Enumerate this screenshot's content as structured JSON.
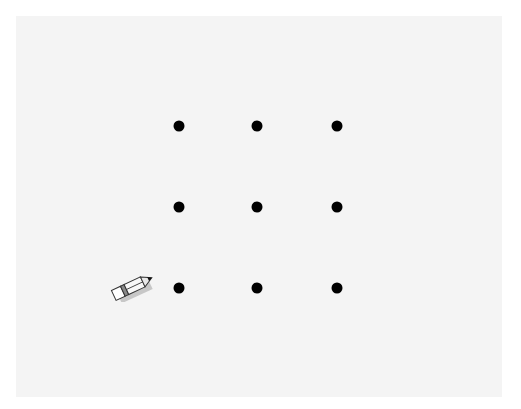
{
  "puzzle": {
    "type": "nine-dots",
    "background_color": "#f4f4f4",
    "dot_color": "#000000",
    "dots": [
      {
        "row": 1,
        "col": 1,
        "x": 179,
        "y": 126
      },
      {
        "row": 1,
        "col": 2,
        "x": 257,
        "y": 126
      },
      {
        "row": 1,
        "col": 3,
        "x": 337,
        "y": 126
      },
      {
        "row": 2,
        "col": 1,
        "x": 179,
        "y": 207
      },
      {
        "row": 2,
        "col": 2,
        "x": 257,
        "y": 207
      },
      {
        "row": 2,
        "col": 3,
        "x": 337,
        "y": 207
      },
      {
        "row": 3,
        "col": 1,
        "x": 179,
        "y": 288
      },
      {
        "row": 3,
        "col": 2,
        "x": 257,
        "y": 288
      },
      {
        "row": 3,
        "col": 3,
        "x": 337,
        "y": 288
      }
    ],
    "tool": {
      "icon": "pencil-icon",
      "x": 108,
      "y": 272
    }
  }
}
